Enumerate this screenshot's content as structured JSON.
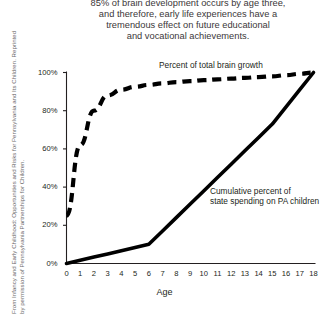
{
  "caption": {
    "lines": [
      "85% of brain development occurs by age three,",
      "and therefore, early life experiences have a",
      "tremendous effect on future educational",
      "and vocational achievements."
    ]
  },
  "credit": {
    "lines": [
      "From Infancy and Early Childhood: Opportunities and Risks for Pennsylvania and Its Children. Reprinted",
      "by permission of Pennsylvania Partnerships for Children."
    ]
  },
  "chart_data": {
    "type": "line",
    "title": "",
    "xlabel": "Age",
    "ylabel": "",
    "xlim": [
      0,
      18
    ],
    "ylim": [
      0,
      100
    ],
    "grid": false,
    "legend_position": "inline-annotations",
    "x_tick_labels": [
      "0",
      "1",
      "2",
      "3",
      "4",
      "5",
      "6",
      "7",
      "8",
      "9",
      "10",
      "11",
      "12",
      "13",
      "14",
      "15",
      "16",
      "17",
      "18"
    ],
    "y_tick_labels": [
      "0%",
      "20%",
      "40%",
      "60%",
      "80%",
      "100%"
    ],
    "y_tick_values": [
      0,
      20,
      40,
      60,
      80,
      100
    ],
    "x": [
      0,
      1,
      2,
      3,
      4,
      5,
      6,
      7,
      8,
      9,
      10,
      11,
      12,
      13,
      14,
      15,
      16,
      17,
      18
    ],
    "series": [
      {
        "name": "Percent of total brain growth",
        "style": "dashed",
        "color": "#000000",
        "annotation": "Percent of total brain growth",
        "values": [
          25,
          62,
          80,
          88,
          91,
          92.5,
          93.5,
          94.3,
          95,
          95.5,
          96,
          96.4,
          96.8,
          97.2,
          97.6,
          98,
          98.6,
          99.3,
          100
        ]
      },
      {
        "name": "Cumulative percent of state spending on PA children",
        "style": "solid",
        "color": "#000000",
        "annotation": "Cumulative percent of\nstate spending on PA children",
        "annotation_lines": [
          "Cumulative percent of",
          "state spending on PA children"
        ],
        "values": [
          0,
          1.7,
          3.4,
          5.0,
          6.7,
          8.4,
          10.1,
          17,
          24,
          31,
          38,
          45,
          52,
          59,
          66,
          73,
          82,
          91,
          100
        ]
      }
    ]
  }
}
